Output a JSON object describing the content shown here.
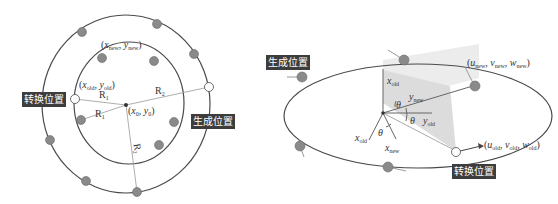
{
  "left_figure": {
    "tag_transform": "转换位置",
    "tag_generate": "生成位置",
    "label_new_point": {
      "x": "x",
      "x_sub": "new",
      "y": "y",
      "y_sub": "new"
    },
    "label_old_point": {
      "x": "x",
      "x_sub": "old",
      "y": "y",
      "y_sub": "old"
    },
    "label_center": {
      "x": "x",
      "x_sub": "0",
      "y": "y",
      "y_sub": "0"
    },
    "radius_labels": [
      "R",
      "R",
      "R",
      "R"
    ],
    "radius_subs": [
      "1",
      "1",
      "2",
      "2"
    ]
  },
  "right_figure": {
    "tag_generate": "生成位置",
    "tag_transform": "转换位置",
    "label_new_vec": {
      "u": "u",
      "u_sub": "new",
      "v": "v",
      "v_sub": "new",
      "w": "w",
      "w_sub": "new"
    },
    "label_old_vec": {
      "u": "u",
      "u_sub": "old",
      "v": "v",
      "v_sub": "old",
      "w": "w",
      "w_sub": "old"
    },
    "axes": {
      "x_old_up": {
        "name": "x",
        "sub": "old"
      },
      "y_new": {
        "name": "y",
        "sub": "new"
      },
      "y_old": {
        "name": "y",
        "sub": "old"
      },
      "x_old_down": {
        "name": "x",
        "sub": "old"
      },
      "x_new": {
        "name": "x",
        "sub": "new"
      }
    },
    "angle_symbol": "θ"
  },
  "colors": {
    "line": "#4a4a4a",
    "dot_fill": "#8a8a8a",
    "dot_stroke": "#6a6a6a",
    "tag_bg": "#3d3d3d",
    "plane": "#d9d9d9",
    "arrow": "#9a9a9a"
  }
}
